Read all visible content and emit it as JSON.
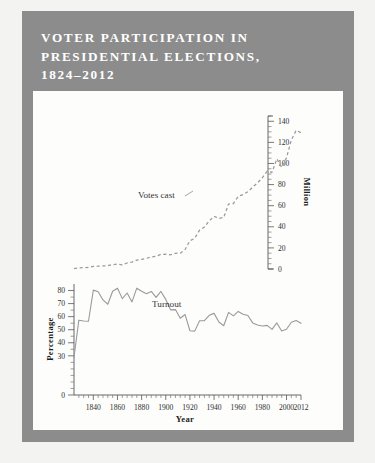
{
  "figure": {
    "title": "Voter Participation in\nPresidential Elections,\n1824–2012",
    "panel_color": "#8c8c8c",
    "card_color": "#fdfdfc",
    "page_color": "#f3f3f1",
    "line_color": "#9a9a9a"
  },
  "chart_data": {
    "type": "line",
    "title": "Voter Participation in Presidential Elections, 1824–2012",
    "xlabel": "Year",
    "grid": false,
    "legend": "inline-annotations",
    "xlim": [
      1824,
      2012
    ],
    "xticks": [
      1840,
      1860,
      1880,
      1900,
      1920,
      1940,
      1960,
      1980,
      2000,
      2012
    ],
    "xtick_labels": [
      "1840",
      "1860",
      "1880",
      "1900",
      "1920",
      "1940",
      "1960",
      "1980",
      "2000",
      "2012"
    ],
    "panels": [
      {
        "name": "votes-cast",
        "series_label": "Votes cast",
        "ylabel": "Million",
        "ylim": [
          0,
          145
        ],
        "yticks": [
          0,
          20,
          40,
          60,
          80,
          100,
          120,
          140
        ],
        "ytick_labels": [
          "0",
          "20",
          "40",
          "60",
          "80",
          "100",
          "120",
          "140"
        ],
        "axis_position": "right",
        "style": "dashed",
        "x": [
          1824,
          1828,
          1832,
          1836,
          1840,
          1844,
          1848,
          1852,
          1856,
          1860,
          1864,
          1868,
          1872,
          1876,
          1880,
          1884,
          1888,
          1892,
          1896,
          1900,
          1904,
          1908,
          1912,
          1916,
          1920,
          1924,
          1928,
          1932,
          1936,
          1940,
          1944,
          1948,
          1952,
          1956,
          1960,
          1964,
          1968,
          1972,
          1976,
          1980,
          1984,
          1988,
          1992,
          1996,
          2000,
          2004,
          2008,
          2012
        ],
        "values": [
          0.4,
          1.1,
          1.3,
          1.5,
          2.4,
          2.7,
          2.9,
          3.2,
          4.1,
          4.7,
          4.0,
          5.7,
          6.5,
          8.4,
          9.2,
          10.1,
          11.4,
          12.1,
          13.9,
          14.0,
          13.5,
          14.9,
          15.0,
          18.5,
          26.8,
          29.1,
          36.8,
          39.8,
          45.6,
          49.9,
          48.0,
          48.8,
          61.6,
          62.0,
          68.8,
          70.6,
          73.2,
          77.7,
          81.6,
          86.5,
          92.7,
          91.6,
          104.4,
          96.3,
          105.4,
          122.3,
          131.4,
          129.1
        ]
      },
      {
        "name": "turnout",
        "series_label": "Turnout",
        "ylabel": "Percentage",
        "ylim": [
          0,
          85
        ],
        "yticks": [
          0,
          30,
          40,
          50,
          60,
          70,
          80
        ],
        "ytick_labels": [
          "0",
          "30",
          "40",
          "50",
          "60",
          "70",
          "80"
        ],
        "axis_position": "left",
        "style": "solid",
        "units": "percent",
        "x": [
          1824,
          1828,
          1832,
          1836,
          1840,
          1844,
          1848,
          1852,
          1856,
          1860,
          1864,
          1868,
          1872,
          1876,
          1880,
          1884,
          1888,
          1892,
          1896,
          1900,
          1904,
          1908,
          1912,
          1916,
          1920,
          1924,
          1928,
          1932,
          1936,
          1940,
          1944,
          1948,
          1952,
          1956,
          1960,
          1964,
          1968,
          1972,
          1976,
          1980,
          1984,
          1988,
          1992,
          1996,
          2000,
          2004,
          2008,
          2012
        ],
        "values": [
          28.9,
          57.3,
          56.7,
          56.5,
          80.3,
          79.0,
          72.8,
          69.5,
          79.4,
          81.8,
          73.8,
          78.1,
          71.3,
          81.8,
          79.4,
          77.5,
          79.3,
          74.7,
          79.3,
          73.2,
          65.2,
          65.4,
          58.8,
          61.6,
          49.2,
          48.9,
          56.9,
          56.9,
          61.0,
          62.5,
          55.9,
          53.0,
          63.3,
          60.6,
          64.0,
          61.9,
          60.9,
          55.2,
          53.6,
          52.8,
          53.3,
          50.3,
          55.2,
          49.0,
          50.3,
          55.7,
          57.1,
          54.9
        ]
      }
    ]
  },
  "annotations": [
    {
      "name": "votes-cast-label",
      "text": "Votes cast"
    },
    {
      "name": "turnout-label",
      "text": "Turnout"
    }
  ]
}
